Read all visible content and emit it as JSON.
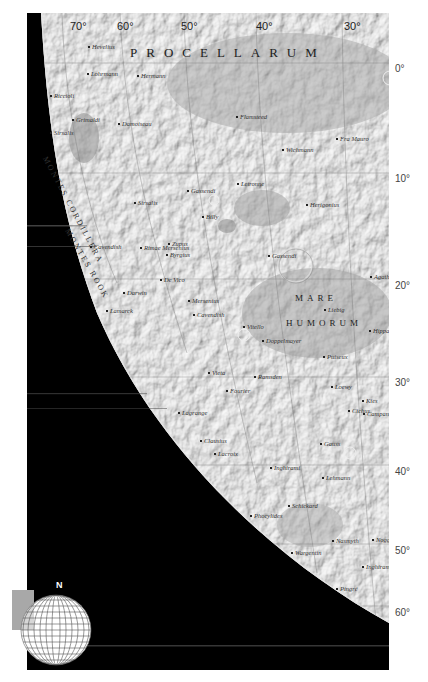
{
  "map": {
    "title_region": "PROCELLARUM",
    "mare_label_1": "MARE",
    "mare_label_2": "HUMORUM",
    "mountain_range": "Montes Cordillera",
    "mountain_range_2": "Montes Rook",
    "colors": {
      "space": "#000000",
      "surface": "#b9b9b9",
      "surface_light": "#d4d4d4",
      "surface_dark": "#9a9a9a",
      "mare": "#a8a8a8",
      "label": "#333333",
      "grid": "#7a7a7a",
      "background": "#ffffff"
    }
  },
  "longitude_labels": [
    {
      "label": "70°",
      "x": 70
    },
    {
      "label": "60°",
      "x": 117
    },
    {
      "label": "50°",
      "x": 181
    },
    {
      "label": "40°",
      "x": 256
    },
    {
      "label": "30°",
      "x": 344
    }
  ],
  "latitude_labels": [
    {
      "label": "0°",
      "y": 63
    },
    {
      "label": "10°",
      "y": 173
    },
    {
      "label": "20°",
      "y": 280
    },
    {
      "label": "30°",
      "y": 377
    },
    {
      "label": "40°",
      "y": 466
    },
    {
      "label": "50°",
      "y": 545
    },
    {
      "label": "60°",
      "y": 607
    }
  ],
  "features": [
    {
      "name": "Hevelius",
      "x": 88,
      "y": 43
    },
    {
      "name": "Lohrmann",
      "x": 87,
      "y": 70
    },
    {
      "name": "Hermann",
      "x": 137,
      "y": 72
    },
    {
      "name": "Riccioli",
      "x": 50,
      "y": 92
    },
    {
      "name": "Grimaldi",
      "x": 72,
      "y": 116
    },
    {
      "name": "Damoiseau",
      "x": 118,
      "y": 120
    },
    {
      "name": "Sirsalis",
      "x": 50,
      "y": 129
    },
    {
      "name": "Flamsteed",
      "x": 236,
      "y": 113
    },
    {
      "name": "Wichmann",
      "x": 282,
      "y": 146
    },
    {
      "name": "Fra Mauro",
      "x": 336,
      "y": 135
    },
    {
      "name": "Letronne",
      "x": 237,
      "y": 180
    },
    {
      "name": "Gassendi",
      "x": 187,
      "y": 187
    },
    {
      "name": "Herigonius",
      "x": 306,
      "y": 201
    },
    {
      "name": "Sirsalis",
      "x": 134,
      "y": 199
    },
    {
      "name": "Billy",
      "x": 202,
      "y": 213
    },
    {
      "name": "Cavendish",
      "x": 90,
      "y": 243
    },
    {
      "name": "Zupus",
      "x": 168,
      "y": 240
    },
    {
      "name": "Byrgius",
      "x": 166,
      "y": 251
    },
    {
      "name": "Rimae Mersenius",
      "x": 140,
      "y": 244
    },
    {
      "name": "Gassendi",
      "x": 268,
      "y": 252
    },
    {
      "name": "Agatharchides",
      "x": 370,
      "y": 273
    },
    {
      "name": "De Vico",
      "x": 160,
      "y": 276
    },
    {
      "name": "Darwin",
      "x": 123,
      "y": 289
    },
    {
      "name": "Mersenius",
      "x": 188,
      "y": 297
    },
    {
      "name": "Cavendish",
      "x": 193,
      "y": 311
    },
    {
      "name": "Lamarck",
      "x": 106,
      "y": 307
    },
    {
      "name": "Liebig",
      "x": 324,
      "y": 306
    },
    {
      "name": "Vitello",
      "x": 243,
      "y": 323
    },
    {
      "name": "Doppelmayer",
      "x": 262,
      "y": 337
    },
    {
      "name": "Hippalus",
      "x": 369,
      "y": 327
    },
    {
      "name": "Puiseux",
      "x": 323,
      "y": 353
    },
    {
      "name": "Vieta",
      "x": 208,
      "y": 369
    },
    {
      "name": "Ramsden",
      "x": 254,
      "y": 373
    },
    {
      "name": "Fourier",
      "x": 226,
      "y": 387
    },
    {
      "name": "Loewy",
      "x": 331,
      "y": 383
    },
    {
      "name": "Kies",
      "x": 362,
      "y": 397
    },
    {
      "name": "Campanus",
      "x": 363,
      "y": 410
    },
    {
      "name": "Lagrange",
      "x": 178,
      "y": 409
    },
    {
      "name": "Clausius",
      "x": 200,
      "y": 437
    },
    {
      "name": "Lacroix",
      "x": 214,
      "y": 450
    },
    {
      "name": "Gauss",
      "x": 320,
      "y": 440
    },
    {
      "name": "Cichus",
      "x": 348,
      "y": 407
    },
    {
      "name": "Inghirami",
      "x": 270,
      "y": 464
    },
    {
      "name": "Lehmann",
      "x": 322,
      "y": 474
    },
    {
      "name": "Schickard",
      "x": 288,
      "y": 502
    },
    {
      "name": "Phocylides",
      "x": 250,
      "y": 512
    },
    {
      "name": "Wargentin",
      "x": 291,
      "y": 549
    },
    {
      "name": "Nasmyth",
      "x": 332,
      "y": 537
    },
    {
      "name": "Noggerath",
      "x": 372,
      "y": 536
    },
    {
      "name": "Pingré",
      "x": 336,
      "y": 585
    },
    {
      "name": "Inghirami",
      "x": 362,
      "y": 563
    }
  ],
  "locator_globe": {
    "north_label": "N",
    "highlight_color": "#a8a8a8"
  }
}
